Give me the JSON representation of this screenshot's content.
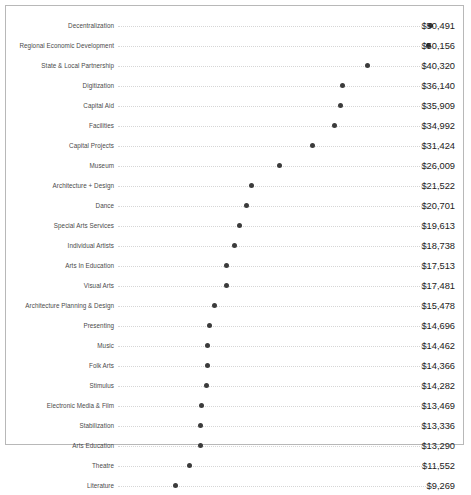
{
  "chart_data": {
    "type": "scatter",
    "title": "",
    "subtitle": "",
    "xlabel": "",
    "ylabel": "",
    "xlim": [
      0,
      52000
    ],
    "grid": false,
    "legend": null,
    "orientation": "horizontal",
    "value_prefix": "$",
    "categories": [
      "Decentralization",
      "Regional Economic Development",
      "State & Local Partnership",
      "Digitization",
      "Capital Aid",
      "Facilities",
      "Capital Projects",
      "Museum",
      "Architecture + Design",
      "Dance",
      "Special Arts Services",
      "Individual Artists",
      "Arts In Education",
      "Visual Arts",
      "Architecture Planning & Design",
      "Presenting",
      "Music",
      "Folk Arts",
      "Stimulus",
      "Electronic Media & Film",
      "Stabilization",
      "Arts Education",
      "Theatre",
      "Literature"
    ],
    "values": [
      50491,
      50156,
      40320,
      36140,
      35909,
      34992,
      31424,
      26009,
      21522,
      20701,
      19613,
      18738,
      17513,
      17481,
      15478,
      14696,
      14462,
      14366,
      14282,
      13469,
      13336,
      13290,
      11552,
      9269
    ],
    "value_labels": [
      "$50,491",
      "$50,156",
      "$40,320",
      "$36,140",
      "$35,909",
      "$34,992",
      "$31,424",
      "$26,009",
      "$21,522",
      "$20,701",
      "$19,613",
      "$18,738",
      "$17,513",
      "$17,481",
      "$15,478",
      "$14,696",
      "$14,462",
      "$14,366",
      "$14,282",
      "$13,469",
      "$13,336",
      "$13,290",
      "$11,552",
      "$9,269"
    ],
    "colors": {
      "dot": "#3b3b3b",
      "leader_line": "#d6d6d6",
      "category_text": "#4a4a4a",
      "value_text": "#1c1c1c",
      "frame_border": "#b8b8b8",
      "background": "#ffffff"
    }
  }
}
